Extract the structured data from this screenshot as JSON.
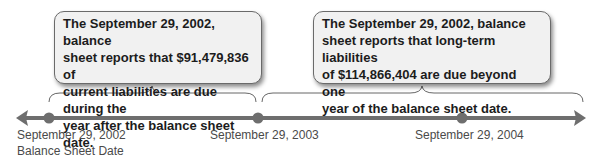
{
  "callouts": [
    {
      "lines": [
        "The September 29, 2002, balance",
        "sheet reports that $91,479,836 of",
        "current liabilities are due during the",
        "year after the balance sheet date."
      ]
    },
    {
      "lines": [
        "The September 29, 2002, balance",
        "sheet reports that long-term liabilities",
        "of $114,866,404 are due beyond one",
        "year of the balance sheet date."
      ]
    }
  ],
  "timeline": {
    "points": [
      {
        "label": "September 29, 2002",
        "sublabel": "Balance Sheet Date"
      },
      {
        "label": "September 29, 2003"
      },
      {
        "label": "September 29, 2004"
      }
    ]
  },
  "colors": {
    "line": "#6e6e6e",
    "dot": "#6e6e6e",
    "box_bg": "#f1f1f1"
  }
}
